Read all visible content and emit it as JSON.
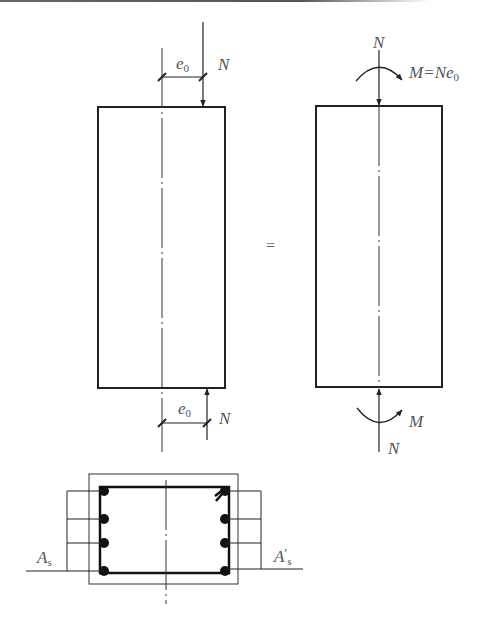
{
  "figure": {
    "colors": {
      "line": "#222222",
      "label": "#555555",
      "bar": "#111111"
    }
  },
  "left_member": {
    "top_load": {
      "force_label": "N",
      "eccentricity_label": "e",
      "eccentricity_sub": "0"
    },
    "bottom_load": {
      "force_label": "N",
      "eccentricity_label": "e",
      "eccentricity_sub": "0"
    }
  },
  "equals_sign": "=",
  "right_member": {
    "top_load": {
      "force_label": "N",
      "moment_label": "M=Ne",
      "moment_sub": "0"
    },
    "bottom_load": {
      "force_label": "N",
      "moment_label": "M"
    }
  },
  "cross_section": {
    "left_steel": {
      "label": "A",
      "sub": "s",
      "bar_count": 4
    },
    "right_steel": {
      "label": "A",
      "prime": "′",
      "sub": "s",
      "bar_count": 4
    }
  }
}
